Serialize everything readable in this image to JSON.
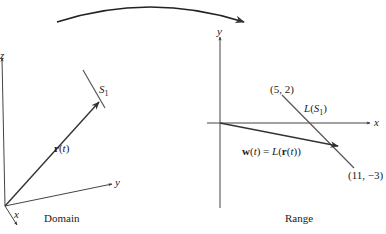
{
  "diagram": {
    "type": "linear-transformation-mapping",
    "colors": {
      "stroke": "#333333",
      "text": "#222222",
      "background": "#ffffff"
    },
    "domain": {
      "caption": "Domain",
      "axes": {
        "x": "x",
        "y": "y",
        "z": "z"
      },
      "segment_label": "S",
      "segment_subscript": "1",
      "vector_label": "r(t)"
    },
    "range": {
      "caption": "Range",
      "axes": {
        "x": "x",
        "y": "y"
      },
      "point_start": "(5, 2)",
      "point_end": "(11, −3)",
      "image_label": "L(S",
      "image_subscript": "1",
      "image_label_close": ")",
      "vector_label": "w(t) = L(r(t))"
    },
    "mapping_arrow": "curved arrow from domain to range"
  }
}
